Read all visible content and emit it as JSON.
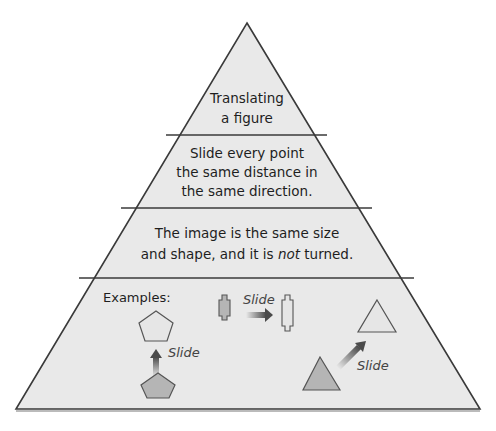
{
  "diagram": {
    "type": "pyramid",
    "levels": [
      {
        "lines": [
          "Translating",
          "a figure"
        ]
      },
      {
        "lines": [
          "Slide every point",
          "the same distance in",
          "the same direction."
        ]
      },
      {
        "lines": [
          "The image is the same size",
          "and shape, and it is ",
          "not",
          " turned."
        ]
      },
      {
        "examples_label": "Examples:"
      }
    ],
    "examples": {
      "pentagon_label": "Slide",
      "rectangle_label": "Slide",
      "triangle_label": "Slide"
    },
    "colors": {
      "fill": "#e9e9e9",
      "outline": "#3a3a3a",
      "shape_dark": "#b5b5b5",
      "shape_light": "#e6e6e6",
      "arrow": "#555555"
    }
  }
}
